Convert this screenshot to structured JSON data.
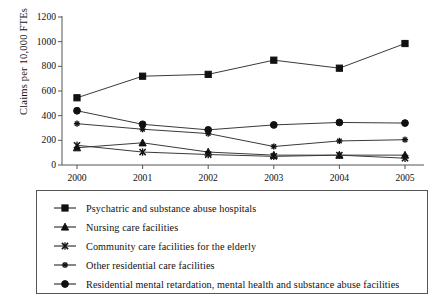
{
  "chart_data": {
    "type": "line",
    "title": "",
    "xlabel": "",
    "ylabel": "Claims per 10,000 FTEs",
    "categories": [
      "2000",
      "2001",
      "2002",
      "2003",
      "2004",
      "2005"
    ],
    "x": [
      2000,
      2001,
      2002,
      2003,
      2004,
      2005
    ],
    "ylim": [
      0,
      1200
    ],
    "yticks": [
      0,
      200,
      400,
      600,
      800,
      1000,
      1200
    ],
    "ytick_labels": [
      "0",
      "200",
      "400",
      "600",
      "800",
      "1000",
      "1200"
    ],
    "grid": false,
    "legend_position": "below-plot",
    "series": [
      {
        "name": "Psychatric and substance abuse hospitals",
        "marker": "square",
        "color": "#111111",
        "values": [
          545,
          720,
          735,
          850,
          785,
          985
        ]
      },
      {
        "name": "Nursing care facilities",
        "marker": "triangle",
        "color": "#111111",
        "values": [
          140,
          180,
          105,
          80,
          80,
          80
        ]
      },
      {
        "name": "Community care facilities for the elderly",
        "marker": "x",
        "color": "#111111",
        "values": [
          160,
          105,
          85,
          70,
          80,
          55
        ]
      },
      {
        "name": "Other residential care facilities",
        "marker": "asterisk",
        "color": "#111111",
        "values": [
          335,
          290,
          255,
          150,
          195,
          205
        ]
      },
      {
        "name": "Residential mental retardation, mental health and substance abuse facilities",
        "marker": "circle",
        "color": "#111111",
        "values": [
          440,
          330,
          285,
          325,
          345,
          340
        ]
      }
    ]
  },
  "axis": {
    "y_title": "Claims per 10,000 FTEs"
  }
}
